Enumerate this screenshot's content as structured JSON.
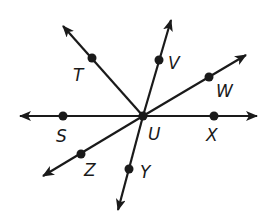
{
  "diagram": {
    "type": "geometry-rays-from-point",
    "center": {
      "label": "U",
      "x": 143,
      "y": 116
    },
    "line": {
      "description": "Line SX through U",
      "left_tip": [
        20,
        116
      ],
      "right_tip": [
        257,
        116
      ]
    },
    "points": [
      {
        "label": "S",
        "dot": [
          63,
          116
        ],
        "label_pos": [
          56,
          142
        ]
      },
      {
        "label": "X",
        "dot": [
          214,
          116
        ],
        "label_pos": [
          206,
          141
        ]
      },
      {
        "label": "T",
        "dot": [
          92,
          58
        ],
        "label_pos": [
          73,
          81
        ]
      },
      {
        "label": "V",
        "dot": [
          159,
          60
        ],
        "label_pos": [
          168,
          69
        ]
      },
      {
        "label": "W",
        "dot": [
          209,
          77
        ],
        "label_pos": [
          216,
          97
        ]
      },
      {
        "label": "Z",
        "dot": [
          81,
          154
        ],
        "label_pos": [
          84,
          176
        ]
      },
      {
        "label": "Y",
        "dot": [
          129,
          169
        ],
        "label_pos": [
          140,
          178
        ]
      },
      {
        "label": "U",
        "dot": [
          143,
          116
        ],
        "label_pos": [
          148,
          140
        ]
      }
    ],
    "rays": [
      {
        "name": "UT",
        "from": [
          143,
          116
        ],
        "tip": [
          63,
          26
        ]
      },
      {
        "name": "UV",
        "from": [
          143,
          116
        ],
        "tip": [
          171,
          20
        ]
      },
      {
        "name": "UW",
        "from": [
          143,
          116
        ],
        "tip": [
          246,
          55
        ]
      },
      {
        "name": "UZ",
        "from": [
          143,
          116
        ],
        "tip": [
          43,
          176
        ]
      },
      {
        "name": "UY",
        "from": [
          143,
          116
        ],
        "tip": [
          118,
          210
        ]
      }
    ],
    "labels": {
      "s": "S",
      "t": "T",
      "u": "U",
      "v": "V",
      "w": "W",
      "x": "X",
      "y": "Y",
      "z": "Z"
    },
    "colors": {
      "ink": "#1a1a1a",
      "background": "#ffffff"
    }
  }
}
